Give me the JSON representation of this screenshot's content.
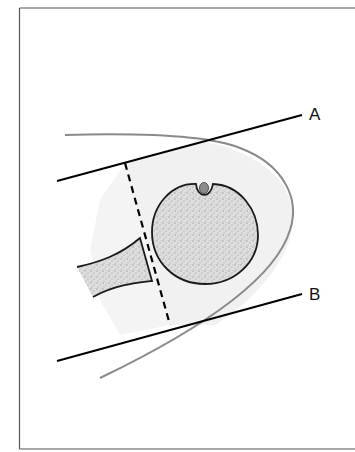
{
  "figure": {
    "labels": {
      "line_a": "A",
      "line_b": "B"
    },
    "colors": {
      "frame": "#555555",
      "outline_soft_tissue": "#8a8a8a",
      "soft_tissue_fill": "#f0f0f0",
      "bone_fill": "#d6d6d6",
      "bone_outline": "#1a1a1a",
      "reference_lines": "#000000",
      "nerve_dot": "#8c8c8c"
    },
    "elements": [
      {
        "name": "line-a",
        "type": "solid reference line"
      },
      {
        "name": "line-b",
        "type": "solid reference line"
      },
      {
        "name": "dashed-line",
        "type": "dashed perpendicular"
      },
      {
        "name": "round-bone-cross-section",
        "type": "circle with notch"
      },
      {
        "name": "tapered-bone",
        "type": "shaft"
      },
      {
        "name": "soft-tissue-outline",
        "type": "curved contour"
      }
    ]
  }
}
